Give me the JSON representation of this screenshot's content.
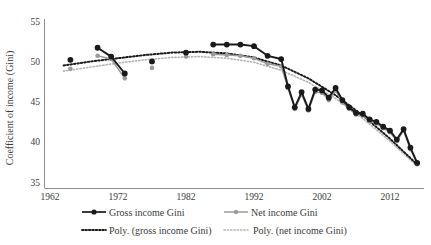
{
  "chart_data": {
    "type": "line",
    "title": "",
    "xlabel": "",
    "ylabel": "Coefficient of income (Gini)",
    "xlim": [
      1962,
      2018
    ],
    "ylim": [
      35,
      55
    ],
    "xticks": [
      1962,
      1972,
      1982,
      1992,
      2002,
      2012
    ],
    "yticks": [
      35,
      40,
      45,
      50,
      55
    ],
    "grid": false,
    "legend_position": "bottom",
    "series": [
      {
        "name": "Gross income Gini",
        "marker": "circle-filled",
        "color": "#1a1a1a",
        "x": [
          1965,
          1969,
          1971,
          1973,
          1977,
          1982,
          1986,
          1988,
          1990,
          1992,
          1994,
          1996,
          1997,
          1998,
          1999,
          2000,
          2001,
          2002,
          2003,
          2004,
          2005,
          2006,
          2007,
          2008,
          2009,
          2010,
          2011,
          2012,
          2013,
          2014,
          2015,
          2016
        ],
        "values": [
          50.3,
          51.8,
          50.7,
          48.6,
          50.1,
          51.2,
          52.2,
          52.2,
          52.2,
          52.0,
          50.8,
          50.4,
          47.0,
          44.4,
          46.3,
          44.2,
          46.6,
          46.5,
          45.6,
          46.8,
          45.3,
          44.4,
          43.7,
          43.6,
          42.9,
          42.6,
          42.0,
          41.5,
          40.4,
          41.7,
          39.4,
          37.5
        ]
      },
      {
        "name": "Net income Gini",
        "marker": "circle-filled",
        "color": "#9a9a9a",
        "x": [
          1965,
          1969,
          1971,
          1973,
          1977,
          1982,
          1986,
          1988,
          1990,
          1992,
          1994,
          1996,
          1997,
          1998,
          1999,
          2000,
          2001,
          2002,
          2003,
          2004,
          2005,
          2006,
          2007,
          2008,
          2009,
          2010,
          2011,
          2012,
          2013,
          2014,
          2015,
          2016
        ],
        "values": [
          49.2,
          50.8,
          50.4,
          48.0,
          49.3,
          50.7,
          51.0,
          50.9,
          50.8,
          50.5,
          49.8,
          49.5,
          46.8,
          44.2,
          46.0,
          44.0,
          46.3,
          46.2,
          45.3,
          46.5,
          45.0,
          44.2,
          43.5,
          43.4,
          42.7,
          42.4,
          41.8,
          41.3,
          40.2,
          41.5,
          39.2,
          37.4
        ]
      }
    ],
    "trendlines": [
      {
        "name": "Poly. (gross income Gini)",
        "style": "dotted",
        "color": "#1a1a1a",
        "x": [
          1964,
          1968,
          1972,
          1976,
          1980,
          1984,
          1988,
          1992,
          1996,
          2000,
          2004,
          2008,
          2012,
          2016
        ],
        "values": [
          49.6,
          50.1,
          50.5,
          50.9,
          51.2,
          51.3,
          51.1,
          50.6,
          49.6,
          48.0,
          45.9,
          43.4,
          40.5,
          37.3
        ]
      },
      {
        "name": "Poly. (net income Gini)",
        "style": "dotted",
        "color": "#b5b5b5",
        "x": [
          1964,
          1968,
          1972,
          1976,
          1980,
          1984,
          1988,
          1992,
          1996,
          2000,
          2004,
          2008,
          2012,
          2016
        ],
        "values": [
          48.9,
          49.4,
          49.9,
          50.3,
          50.6,
          50.7,
          50.5,
          50.0,
          49.0,
          47.5,
          45.5,
          43.0,
          40.2,
          37.1
        ]
      }
    ]
  },
  "axis": {
    "ylabel": "Coefficient of income (Gini)",
    "ytick_labels": [
      "55",
      "50",
      "45",
      "40",
      "35"
    ],
    "xtick_labels": [
      "1962",
      "1972",
      "1982",
      "1992",
      "2002",
      "2012"
    ]
  },
  "legend": {
    "items": [
      {
        "label": "Gross income Gini",
        "marker": "solid-line-with-dot",
        "color": "#1a1a1a"
      },
      {
        "label": "Net income Gini",
        "marker": "solid-line-with-dot",
        "color": "#9a9a9a"
      },
      {
        "label": "Poly. (gross income Gini)",
        "marker": "dotted-line",
        "color": "#1a1a1a"
      },
      {
        "label": "Poly. (net income Gini)",
        "marker": "dotted-line",
        "color": "#b5b5b5"
      }
    ]
  },
  "colors": {
    "gross": "#1a1a1a",
    "net": "#9a9a9a",
    "poly_gross": "#1a1a1a",
    "poly_net": "#b5b5b5",
    "axis": "#7a7a7a",
    "text": "#3b3b3b",
    "background": "#ffffff"
  }
}
